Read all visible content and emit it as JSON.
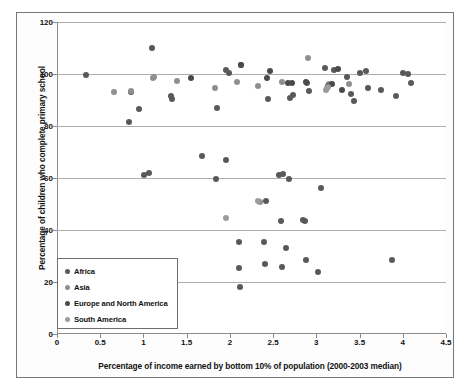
{
  "chart_data": {
    "type": "scatter",
    "title": "",
    "xlabel": "Percentage of income earned by bottom 10% of population (2000-2003 median)",
    "ylabel": "Percentage of children who complete primary school",
    "xlim": [
      0,
      4.5
    ],
    "ylim": [
      0,
      120
    ],
    "xticks": [
      "0",
      "0.5",
      "1",
      "1.5",
      "2",
      "2.5",
      "3",
      "3.5",
      "4",
      "4.5"
    ],
    "xtick_values": [
      0,
      0.5,
      1,
      1.5,
      2,
      2.5,
      3,
      3.5,
      4,
      4.5
    ],
    "yticks": [
      "0",
      "20",
      "40",
      "60",
      "80",
      "100",
      "120"
    ],
    "ytick_values": [
      0,
      20,
      40,
      60,
      80,
      100,
      120
    ],
    "grid": "horizontal",
    "legend_position": "lower-left-inside",
    "series": [
      {
        "name": "Africa",
        "color": "#595959",
        "points": [
          [
            0.34,
            99.5
          ],
          [
            0.83,
            81.5
          ],
          [
            0.86,
            93.0
          ],
          [
            0.95,
            86.5
          ],
          [
            1.01,
            61.0
          ],
          [
            1.07,
            61.8
          ],
          [
            1.1,
            110.0
          ],
          [
            1.32,
            91.5
          ],
          [
            1.33,
            90.5
          ],
          [
            1.68,
            68.5
          ],
          [
            1.84,
            59.5
          ],
          [
            1.85,
            87.0
          ],
          [
            1.95,
            101.5
          ],
          [
            1.96,
            67.0
          ],
          [
            1.99,
            100.5
          ],
          [
            2.1,
            35.5
          ],
          [
            2.11,
            25.5
          ],
          [
            2.12,
            18.0
          ],
          [
            2.13,
            103.5
          ],
          [
            2.4,
            35.5
          ],
          [
            2.41,
            26.8
          ],
          [
            2.42,
            51.0
          ],
          [
            2.44,
            90.5
          ],
          [
            2.57,
            61.0
          ],
          [
            2.59,
            43.5
          ],
          [
            2.6,
            25.8
          ],
          [
            2.62,
            61.5
          ],
          [
            2.65,
            33.0
          ],
          [
            2.68,
            59.8
          ],
          [
            2.7,
            90.8
          ],
          [
            2.73,
            92.0
          ],
          [
            2.85,
            44.0
          ],
          [
            2.87,
            43.5
          ],
          [
            2.88,
            28.5
          ],
          [
            2.89,
            96.5
          ],
          [
            2.91,
            93.5
          ],
          [
            3.02,
            24.0
          ],
          [
            3.05,
            56.0
          ],
          [
            3.1,
            102.5
          ],
          [
            3.2,
            101.5
          ],
          [
            3.36,
            99.0
          ],
          [
            3.4,
            92.5
          ],
          [
            3.43,
            89.5
          ],
          [
            3.5,
            100.5
          ],
          [
            3.58,
            101.0
          ],
          [
            3.6,
            94.5
          ],
          [
            3.75,
            94.0
          ],
          [
            3.88,
            28.5
          ],
          [
            3.92,
            91.5
          ],
          [
            4.0,
            100.5
          ],
          [
            4.06,
            100.0
          ],
          [
            4.1,
            96.5
          ]
        ]
      },
      {
        "name": "Asia",
        "color": "#8f8f8f",
        "points": [
          [
            0.66,
            93.0
          ],
          [
            0.86,
            93.5
          ],
          [
            1.11,
            98.5
          ],
          [
            1.12,
            99.0
          ],
          [
            1.39,
            97.5
          ],
          [
            1.83,
            94.5
          ],
          [
            2.08,
            97.0
          ],
          [
            2.33,
            95.5
          ],
          [
            2.35,
            50.8
          ],
          [
            2.6,
            96.8
          ],
          [
            2.9,
            106.0
          ],
          [
            3.12,
            94.5
          ],
          [
            3.15,
            96.0
          ],
          [
            3.38,
            96.0
          ]
        ]
      },
      {
        "name": "Europe and North America",
        "color": "#4a4a4a",
        "points": [
          [
            1.55,
            98.5
          ],
          [
            2.13,
            103.5
          ],
          [
            2.43,
            98.5
          ],
          [
            2.46,
            101.0
          ],
          [
            2.67,
            96.5
          ],
          [
            2.72,
            96.5
          ],
          [
            2.88,
            97.0
          ],
          [
            3.13,
            95.5
          ],
          [
            3.18,
            96.0
          ],
          [
            3.25,
            102.0
          ],
          [
            3.3,
            94.0
          ]
        ]
      },
      {
        "name": "South America",
        "color": "#9c9c9c",
        "points": [
          [
            1.95,
            44.8
          ],
          [
            2.32,
            51.0
          ],
          [
            3.11,
            94.0
          ],
          [
            3.14,
            95.0
          ]
        ]
      }
    ]
  },
  "axes": {
    "y_title": "Percentage of children who complete primary school",
    "x_title": "Percentage of income earned by bottom 10% of population (2000-2003 median)"
  },
  "legend": {
    "items": [
      {
        "label": "Africa",
        "color": "#595959"
      },
      {
        "label": "Asia",
        "color": "#8f8f8f"
      },
      {
        "label": "Europe and North America",
        "color": "#4a4a4a"
      },
      {
        "label": "South America",
        "color": "#9c9c9c"
      }
    ]
  }
}
